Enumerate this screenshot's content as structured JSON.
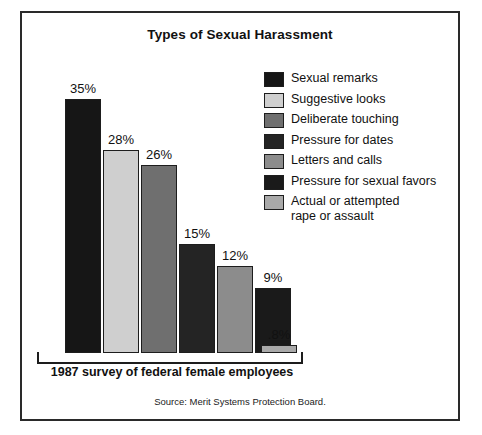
{
  "frame": {
    "title": "Types of Sexual Harassment",
    "axis_caption": "1987 survey of federal female employees",
    "source": "Source: Merit Systems Protection Board."
  },
  "chart_data": {
    "type": "bar",
    "title": "Types of Sexual Harassment",
    "xlabel": "1987 survey of federal female employees",
    "ylabel": "",
    "ylim": [
      0,
      35
    ],
    "grid": false,
    "legend_position": "right",
    "source": "Source: Merit Systems Protection Board.",
    "categories": [
      "Sexual remarks",
      "Suggestive looks",
      "Deliberate touching",
      "Pressure for dates",
      "Letters and calls",
      "Pressure for sexual favors",
      "Actual or attempted rape or assault"
    ],
    "values": [
      35,
      28,
      26,
      15,
      12,
      9,
      0.8
    ],
    "data_labels": [
      "35%",
      "28%",
      "26%",
      "15%",
      "12%",
      "9%",
      ".8%"
    ],
    "colors": [
      "#161616",
      "#cfcfcf",
      "#6f6f6f",
      "#242424",
      "#8c8c8c",
      "#1a1a1a",
      "#a9a9a9"
    ],
    "bars": [
      {
        "label": "35%",
        "value": 35,
        "color": "#161616",
        "x": 43,
        "width": 36
      },
      {
        "label": "28%",
        "value": 28,
        "color": "#cfcfcf",
        "x": 81,
        "width": 36
      },
      {
        "label": "26%",
        "value": 26,
        "color": "#6f6f6f",
        "x": 119,
        "width": 36
      },
      {
        "label": "15%",
        "value": 15,
        "color": "#242424",
        "x": 157,
        "width": 36
      },
      {
        "label": "12%",
        "value": 12,
        "color": "#8c8c8c",
        "x": 195,
        "width": 36
      },
      {
        "label": "9%",
        "value": 9,
        "color": "#1a1a1a",
        "x": 233,
        "width": 36
      },
      {
        "label": ".8%",
        "value": 0.8,
        "color": "#a9a9a9",
        "x": 239,
        "width": 36
      }
    ]
  },
  "legend": {
    "items": [
      {
        "label": "Sexual remarks",
        "color": "#161616"
      },
      {
        "label": "Suggestive looks",
        "color": "#cfcfcf"
      },
      {
        "label": "Deliberate touching",
        "color": "#6f6f6f"
      },
      {
        "label": "Pressure for dates",
        "color": "#242424"
      },
      {
        "label": "Letters and calls",
        "color": "#8c8c8c"
      },
      {
        "label": "Pressure for sexual favors",
        "color": "#1a1a1a"
      },
      {
        "label": "Actual or attempted\nrape or assault",
        "color": "#a9a9a9"
      }
    ]
  }
}
